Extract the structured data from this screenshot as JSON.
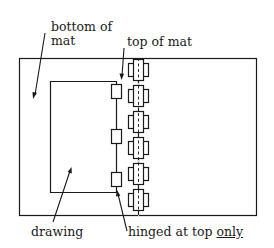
{
  "labels": {
    "bottom_of_mat_line1": "bottom of",
    "bottom_of_mat_line2": "mat",
    "top_of_mat": "top of mat",
    "drawing": "drawing",
    "hinged_prefix": "hinged at top ",
    "hinged_emphasis": "only"
  },
  "colors": {
    "stroke": "#1a1a1a",
    "background": "#ffffff"
  }
}
